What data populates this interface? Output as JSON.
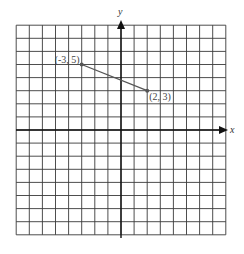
{
  "chart_data": {
    "type": "line",
    "title": "",
    "xlabel": "x",
    "ylabel": "y",
    "xlim": [
      -8,
      8
    ],
    "ylim": [
      -8,
      8
    ],
    "grid": true,
    "grid_step": 1,
    "series": [
      {
        "name": "segment",
        "points": [
          {
            "x": -3,
            "y": 5,
            "label": "(-3, 5)"
          },
          {
            "x": 2,
            "y": 3,
            "label": "(2, 3)"
          }
        ]
      }
    ]
  },
  "labels": {
    "x_axis": "x",
    "y_axis": "y",
    "point_a": "(-3, 5)",
    "point_b": "(2, 3)"
  }
}
